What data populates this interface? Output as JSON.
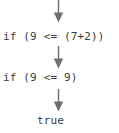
{
  "diagram": {
    "type": "evaluation-trace",
    "title": "",
    "background_color": "#ffffff",
    "text_color": "#3b3b3b",
    "arrow_color": "#6f6f6f",
    "steps": [
      {
        "id": "step-1",
        "text": "if (9 <= (7+2))"
      },
      {
        "id": "step-2",
        "text": "if (9 <= 9)"
      },
      {
        "id": "step-3",
        "text": "true"
      }
    ],
    "arrows": [
      {
        "id": "arrow-1",
        "direction": "down",
        "glyph": "down-arrow-icon"
      },
      {
        "id": "arrow-2",
        "direction": "down",
        "glyph": "down-arrow-icon"
      },
      {
        "id": "arrow-3",
        "direction": "down",
        "glyph": "down-arrow-icon"
      }
    ]
  }
}
